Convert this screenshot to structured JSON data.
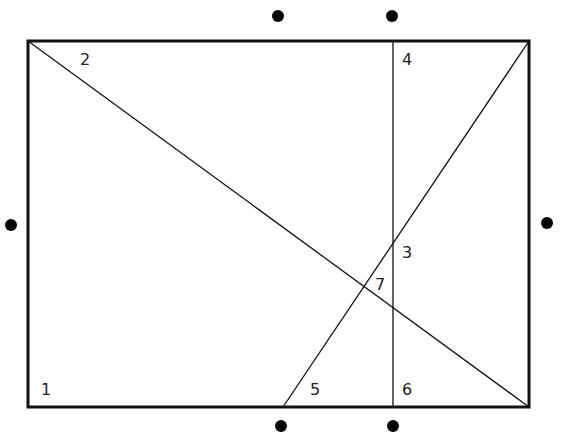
{
  "diagram": {
    "width": 563,
    "height": 444,
    "colors": {
      "stroke": "#111111",
      "dot": "#000000",
      "label": "#222222"
    },
    "rectangle": {
      "x1": 28,
      "y1": 41,
      "x2": 529,
      "y2": 407
    },
    "lines": [
      {
        "name": "diagonal-top-left-to-bottom-right",
        "x1": 28,
        "y1": 41,
        "x2": 529,
        "y2": 407
      },
      {
        "name": "vertical-line",
        "x1": 393,
        "y1": 41,
        "x2": 393,
        "y2": 407
      },
      {
        "name": "diagonal-bottom-to-top-right",
        "x1": 283,
        "y1": 407,
        "x2": 529,
        "y2": 41
      }
    ],
    "dots": [
      {
        "name": "dot-top-left",
        "x": 278,
        "y": 16
      },
      {
        "name": "dot-top-right",
        "x": 392,
        "y": 16
      },
      {
        "name": "dot-left",
        "x": 11,
        "y": 225
      },
      {
        "name": "dot-right",
        "x": 547,
        "y": 223
      },
      {
        "name": "dot-bottom-left",
        "x": 281,
        "y": 426
      },
      {
        "name": "dot-bottom-right",
        "x": 393,
        "y": 426
      }
    ],
    "labels": [
      {
        "text": "1",
        "x": 41,
        "y": 395
      },
      {
        "text": "2",
        "x": 80,
        "y": 65
      },
      {
        "text": "3",
        "x": 402,
        "y": 258
      },
      {
        "text": "4",
        "x": 402,
        "y": 65
      },
      {
        "text": "5",
        "x": 310,
        "y": 395
      },
      {
        "text": "6",
        "x": 402,
        "y": 395
      },
      {
        "text": "7",
        "x": 375,
        "y": 290
      }
    ]
  }
}
